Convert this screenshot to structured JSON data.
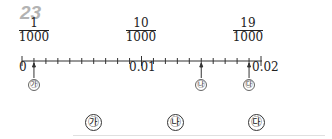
{
  "question_number": "23",
  "number_line": {
    "start": 0,
    "end": 0.02,
    "minor_step": 0.001,
    "fraction_labels": [
      {
        "numerator": "1",
        "denominator": "1000"
      },
      {
        "numerator": "10",
        "denominator": "1000"
      },
      {
        "numerator": "19",
        "denominator": "1000"
      }
    ],
    "tick_labels": [
      "0",
      "0.01",
      "0.02"
    ],
    "arrows": [
      {
        "label": "㉮",
        "value": 0.001
      },
      {
        "label": "㉯",
        "value": 0.015
      },
      {
        "label": "㉰",
        "value": 0.019
      }
    ]
  },
  "answer_labels": [
    "㉮",
    "㉯",
    "㉰"
  ]
}
